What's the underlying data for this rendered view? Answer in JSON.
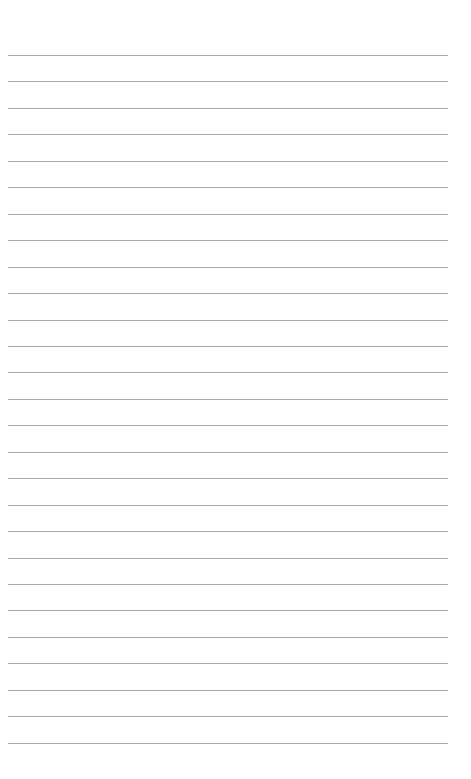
{
  "page": {
    "type": "lined-paper",
    "background_color": "#ffffff",
    "line_color": "#a9a9a9",
    "line_count": 27,
    "first_line_y": 55,
    "line_spacing": 26.45,
    "line_left": 8,
    "line_width": 440
  }
}
